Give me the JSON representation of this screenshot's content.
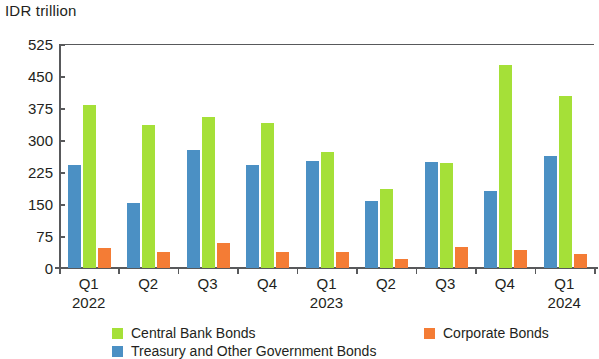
{
  "chart_data": {
    "type": "bar",
    "title": "",
    "subtitle": "",
    "xlabel": "",
    "ylabel": "IDR trillion",
    "ylim": [
      0,
      525
    ],
    "yticks": [
      0,
      75,
      150,
      225,
      300,
      375,
      450,
      525
    ],
    "ytick_labels": [
      "0",
      "75",
      "150",
      "225",
      "300",
      "375",
      "450",
      "525"
    ],
    "grid": false,
    "legend_position": "bottom",
    "categories": [
      "Q1",
      "Q2",
      "Q3",
      "Q4",
      "Q1",
      "Q2",
      "Q3",
      "Q4",
      "Q1"
    ],
    "group_years": [
      "2022",
      "",
      "",
      "",
      "2023",
      "",
      "",
      "",
      "2024"
    ],
    "x": [
      {
        "quarter": "Q1",
        "year": "2022"
      },
      {
        "quarter": "Q2",
        "year": ""
      },
      {
        "quarter": "Q3",
        "year": ""
      },
      {
        "quarter": "Q4",
        "year": ""
      },
      {
        "quarter": "Q1",
        "year": "2023"
      },
      {
        "quarter": "Q2",
        "year": ""
      },
      {
        "quarter": "Q3",
        "year": ""
      },
      {
        "quarter": "Q4",
        "year": ""
      },
      {
        "quarter": "Q1",
        "year": "2024"
      }
    ],
    "series": [
      {
        "name": "Treasury and Other Government Bonds",
        "color": "#4b90c4",
        "values": [
          242,
          152,
          276,
          241,
          251,
          157,
          248,
          181,
          262
        ]
      },
      {
        "name": "Central Bank Bonds",
        "color": "#a5e038",
        "values": [
          381,
          336,
          355,
          341,
          272,
          186,
          245,
          476,
          402
        ]
      },
      {
        "name": "Corporate Bonds",
        "color": "#f47c35",
        "values": [
          47,
          37,
          58,
          37,
          37,
          22,
          49,
          43,
          34
        ]
      }
    ]
  },
  "legend": {
    "items": [
      {
        "label": "Central Bank Bonds",
        "color": "#a5e038"
      },
      {
        "label": "Corporate Bonds",
        "color": "#f47c35"
      },
      {
        "label": "Treasury and Other Government Bonds",
        "color": "#4b90c4"
      }
    ]
  },
  "colors": {
    "central_bank": "#a5e038",
    "treasury": "#4b90c4",
    "corporate": "#f47c35",
    "axis": "#58595b",
    "text": "#231f20",
    "background": "#ffffff"
  }
}
